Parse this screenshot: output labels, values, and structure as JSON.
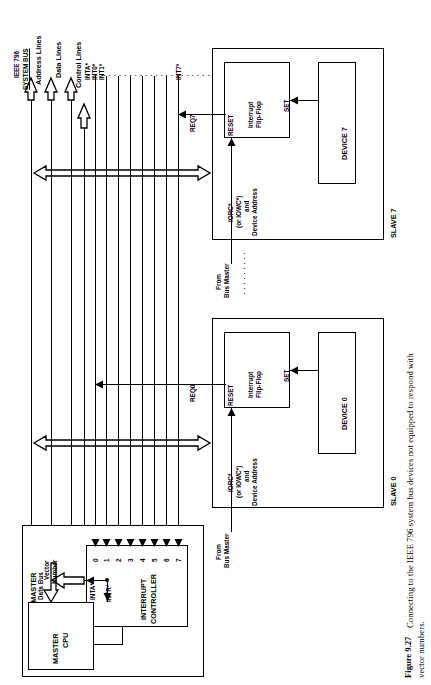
{
  "figure": {
    "number": "Figure 9.27",
    "caption_line1": "Connecting to the IEEE 796 system bus devices not equipped to respond with",
    "caption_line2": "vector numbers."
  },
  "bus": {
    "title_line1": "IEEE 796",
    "title_line2": "SYSTEM BUS",
    "lines": [
      {
        "id": "address-lines",
        "label": "Address Lines"
      },
      {
        "id": "data-lines",
        "label": "Data Lines"
      },
      {
        "id": "control-lines",
        "label": "Control Lines"
      }
    ],
    "signals": [
      {
        "id": "inta",
        "label": "INTA*"
      },
      {
        "id": "int0",
        "label": "INT0*"
      },
      {
        "id": "int1",
        "label": "INT1*"
      },
      {
        "id": "int7",
        "label": "INT7*"
      }
    ],
    "ellipsis": "······················"
  },
  "slaves": [
    {
      "id": "slave-7",
      "title": "SLAVE 7",
      "request_label": "REQ7",
      "flipflop": {
        "line1": "Interrupt",
        "line2": "Flip-Flop",
        "set": "SET",
        "reset": "RESET"
      },
      "decode_label": {
        "line1": "IORC*",
        "line2": "(or IOWC*)",
        "line3": "and",
        "line4": "Device Address"
      },
      "device": "DEVICE 7",
      "from_bus_master": {
        "line1": "From",
        "line2": "Bus Master"
      }
    },
    {
      "id": "slave-0",
      "title": "SLAVE 0",
      "request_label": "REQ0",
      "flipflop": {
        "line1": "Interrupt",
        "line2": "Flip-Flop",
        "set": "SET",
        "reset": "RESET"
      },
      "decode_label": {
        "line1": "IORC*",
        "line2": "(or IOWC*)",
        "line3": "and",
        "line4": "Device Address"
      },
      "device": "DEVICE 0",
      "from_bus_master": {
        "line1": "From",
        "line2": "Bus Master"
      }
    }
  ],
  "slave_separator_ellipsis": "·········",
  "bus_master": {
    "title": "BUS MASTER",
    "cpu": {
      "line1": "MASTER",
      "line2": "CPU"
    },
    "controller": {
      "line1": "INTERRUPT",
      "line2": "CONTROLLER"
    },
    "inputs": [
      "0",
      "1",
      "2",
      "3",
      "4",
      "5",
      "6",
      "7"
    ],
    "vector_number": {
      "line1": "Vector",
      "line2": "Number"
    },
    "data_bus": "Data Bus",
    "inta": "INTA*",
    "intr": "INTR*"
  },
  "colors": {
    "ink": "#000000",
    "paper": "#ffffff"
  }
}
